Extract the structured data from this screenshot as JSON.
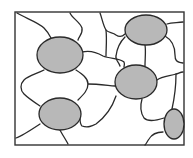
{
  "diagram": {
    "colors": {
      "background": "#ffffff",
      "boundary": "#2a2a2a",
      "particle_fill": "#b8b8b8",
      "frame": "#333333"
    },
    "frame": {
      "x": 15,
      "y": 12,
      "width": 169,
      "height": 133
    },
    "particles": [
      {
        "id": "particle-1",
        "cx": 60,
        "cy": 55,
        "rx": 23,
        "ry": 18
      },
      {
        "id": "particle-2",
        "cx": 146,
        "cy": 30,
        "rx": 21,
        "ry": 15
      },
      {
        "id": "particle-3",
        "cx": 136,
        "cy": 82,
        "rx": 21,
        "ry": 17
      },
      {
        "id": "particle-4",
        "cx": 60,
        "cy": 114,
        "rx": 21,
        "ry": 16
      },
      {
        "id": "particle-5",
        "cx": 174,
        "cy": 124,
        "rx": 10,
        "ry": 15
      }
    ],
    "boundaries": [
      "M17,13 C25,18 38,22 44,28 C48,32 50,36 51,38",
      "M70,13 C72,18 80,22 82,28 C83,34 79,36 78,40",
      "M82,52 C90,50 98,53 103,56 C110,59 120,58 124,62 C125,64 124,66 124,67",
      "M100,13 C102,18 103,25 106,30 C108,33 113,32 116,35 C119,37 122,37 125,34",
      "M106,30 C107,40 106,48 106,56",
      "M125,37 C120,42 117,48 116,56 C115,60 119,62 120,66",
      "M145,45 C146,52 145,58 145,66",
      "M165,36 C172,40 175,46 175,55 C175,60 176,62 183,63",
      "M167,24 C172,22 177,23 183,22",
      "M157,80 C162,76 170,76 176,74 C178,74 180,72 183,72",
      "M44,70 C36,74 28,76 24,80 C20,84 20,90 24,94 C28,98 34,102 40,106",
      "M76,70 C82,74 88,78 88,84 C88,90 84,94 78,100",
      "M88,84 C96,84 104,85 115,86",
      "M116,96 C112,108 104,118 96,124 C92,126 88,128 82,126 C80,124 80,120 80,118",
      "M142,99 C140,106 140,112 144,118 C148,122 158,120 164,118",
      "M176,74 C176,90 174,100 172,109",
      "M16,138 C22,136 28,132 40,124",
      "M60,130 C62,134 66,140 68,144",
      "M163,132 C156,132 152,134 149,139 C147,142 146,144 145,145"
    ]
  }
}
